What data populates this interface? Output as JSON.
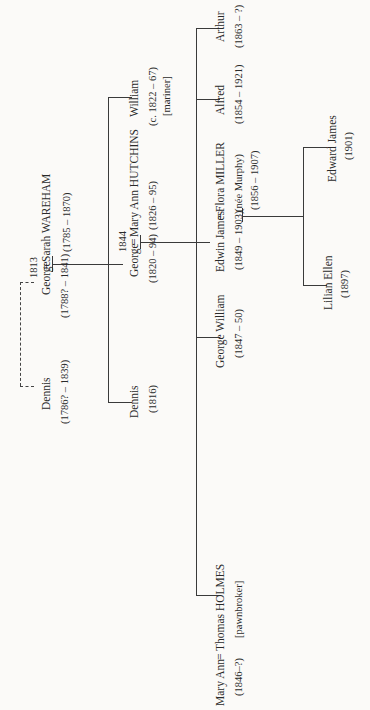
{
  "orientation": "rotated -90deg (text reads bottom-to-top)",
  "marriages": {
    "m1": {
      "year": "1813"
    },
    "m2": {
      "year": "1844"
    }
  },
  "people": {
    "dennis_sr": {
      "name": "Dennis",
      "dates": "(1786? – 1839)"
    },
    "george_sr": {
      "name": "George",
      "dates": "(1788? – 1841)"
    },
    "sarah": {
      "name": "Sarah WAREHAM",
      "dates": "(1785 – 1870)"
    },
    "dennis_jr": {
      "name": "Dennis",
      "dates": "(1816)"
    },
    "george_jr": {
      "name": "George",
      "dates": "(1820 – 94)"
    },
    "mary_ann_h": {
      "name": "Mary Ann HUTCHINS",
      "dates": "(1826 – 95)"
    },
    "william": {
      "name": "William",
      "dates": "(c. 1822 – 67)",
      "note": "[mariner]"
    },
    "mary_ann": {
      "name": "Mary Ann",
      "dates": "(1846–?)"
    },
    "thomas": {
      "name": "Thomas HOLMES",
      "note": "[pawnbroker]"
    },
    "george_william": {
      "name": "George William",
      "dates": "(1847 – 50)"
    },
    "edwin": {
      "name": "Edwin James",
      "dates": "(1849 – 1903)"
    },
    "flora": {
      "name": "Flora MILLER",
      "nee": "(née Murphy)",
      "dates": "(1856 – 1907)"
    },
    "alfred": {
      "name": "Alfred",
      "dates": "(1854 – 1921)"
    },
    "arthur": {
      "name": "Arthur",
      "dates": "(1863 – ?)"
    },
    "lilian": {
      "name": "Lilian Ellen",
      "dates": "(1897)"
    },
    "edward": {
      "name": "Edward James",
      "dates": "(1901)"
    }
  },
  "symbols": {
    "marriage": "="
  }
}
